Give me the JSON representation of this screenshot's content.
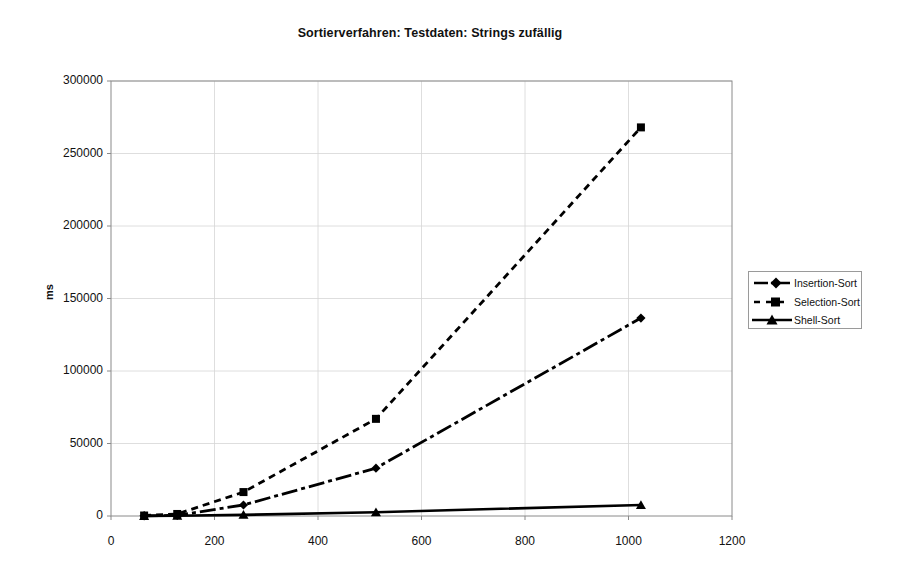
{
  "chart_data": {
    "type": "line",
    "title": "Sortierverfahren: Testdaten: Strings zufällig",
    "xlabel": "",
    "ylabel": "ms",
    "xlim": [
      0,
      1200
    ],
    "ylim": [
      0,
      300000
    ],
    "x_ticks": [
      "0",
      "200",
      "400",
      "600",
      "800",
      "1000",
      "1200"
    ],
    "x_tick_values": [
      0,
      200,
      400,
      600,
      800,
      1000,
      1200
    ],
    "y_ticks": [
      "0",
      "50000",
      "100000",
      "150000",
      "200000",
      "250000",
      "300000"
    ],
    "y_tick_values": [
      0,
      50000,
      100000,
      150000,
      200000,
      250000,
      300000
    ],
    "grid": true,
    "legend_position": "right",
    "x": [
      64,
      128,
      256,
      512,
      1024
    ],
    "series": [
      {
        "name": "Insertion-Sort",
        "values": [
          110,
          450,
          7600,
          33000,
          136500
        ],
        "style": "dash-dot",
        "marker": "diamond",
        "color": "#000000"
      },
      {
        "name": "Selection-Sort",
        "values": [
          330,
          1400,
          16500,
          67000,
          268000
        ],
        "style": "dashed",
        "marker": "square",
        "color": "#000000"
      },
      {
        "name": "Shell-Sort",
        "values": [
          60,
          180,
          800,
          2600,
          7600
        ],
        "style": "solid",
        "marker": "triangle",
        "color": "#000000"
      }
    ]
  },
  "legend": {
    "entries": [
      {
        "label": "Insertion-Sort"
      },
      {
        "label": "Selection-Sort"
      },
      {
        "label": "Shell-Sort"
      }
    ]
  },
  "axis": {
    "y_title": "ms"
  }
}
